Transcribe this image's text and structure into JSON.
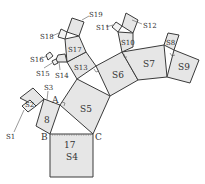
{
  "figure": {
    "type": "pythagorean-tree",
    "points": {
      "A": "A",
      "B": "B",
      "C": "C"
    },
    "values": {
      "S3_side_label": "8",
      "S4_side_label": "17"
    },
    "squares": {
      "S1": "S1",
      "S2": "S2",
      "S3": "S3",
      "S4": "S4",
      "S5": "S5",
      "S6": "S6",
      "S7": "S7",
      "S8": "S8",
      "S9": "S9",
      "S10": "S10",
      "S11": "S11",
      "S12": "S12",
      "S13": "S13",
      "S14": "S14",
      "S15": "S15",
      "S16": "S16",
      "S17": "S17",
      "S18": "S18",
      "S19": "S19"
    }
  }
}
